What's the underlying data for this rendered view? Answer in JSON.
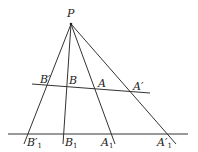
{
  "diagram": {
    "title": "",
    "points": {
      "P": {
        "label": "P",
        "x": 71,
        "y": 24
      },
      "B_prime": {
        "label": "B′",
        "x": 46,
        "y": 85
      },
      "B": {
        "label": "B",
        "x": 67,
        "y": 86
      },
      "A": {
        "label": "A",
        "x": 96,
        "y": 88
      },
      "A_prime": {
        "label": "A′",
        "x": 131,
        "y": 92
      },
      "B1_prime": {
        "label": "B′",
        "sub": "1",
        "x": 27,
        "y": 134
      },
      "B1": {
        "label": "B",
        "sub": "1",
        "x": 64,
        "y": 134
      },
      "A1": {
        "label": "A",
        "sub": "1",
        "x": 112,
        "y": 134
      },
      "A1_prime": {
        "label": "A′",
        "sub": "1",
        "x": 168,
        "y": 134
      }
    },
    "lines": [
      {
        "name": "upper-transversal",
        "x1": 32,
        "y1": 84,
        "x2": 150,
        "y2": 93
      },
      {
        "name": "lower-transversal",
        "x1": 8,
        "y1": 134,
        "x2": 188,
        "y2": 134
      },
      {
        "name": "ray-P-B1-prime",
        "x1": 71,
        "y1": 24,
        "x2": 24,
        "y2": 144
      },
      {
        "name": "ray-P-B1",
        "x1": 71,
        "y1": 24,
        "x2": 63,
        "y2": 144
      },
      {
        "name": "ray-P-A1",
        "x1": 71,
        "y1": 24,
        "x2": 115,
        "y2": 144
      },
      {
        "name": "ray-P-A1-prime",
        "x1": 71,
        "y1": 24,
        "x2": 176,
        "y2": 144
      }
    ]
  }
}
